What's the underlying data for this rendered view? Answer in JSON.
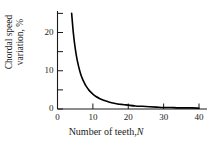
{
  "chart_data": {
    "type": "line",
    "title": "",
    "subtitle": "",
    "xlabel": "Number of teeth, N",
    "xlabel_text": "Number of teeth,",
    "xlabel_variable": "N",
    "ylabel": "Chordal speed variation, %",
    "ylabel_line1": "Chordal speed",
    "ylabel_line2": "variation, %",
    "xlim": [
      0,
      42
    ],
    "ylim": [
      0,
      26
    ],
    "xticks": [
      0,
      10,
      20,
      30,
      40
    ],
    "xticklabels": [
      "0",
      "10",
      "20",
      "30",
      "40"
    ],
    "yticks": [
      0,
      10,
      20
    ],
    "yticklabels": [
      "0",
      "10",
      "20"
    ],
    "y_minor_ticks": [
      5,
      15,
      25
    ],
    "grid": false,
    "legend": null,
    "legend_position": "none",
    "series": [
      {
        "name": "Chordal speed variation",
        "color": "#000000",
        "linewidth": 1.6,
        "x": [
          4,
          4.5,
          5,
          5.5,
          6,
          6.5,
          7,
          7.5,
          8,
          9,
          10,
          11,
          12,
          13,
          14,
          15,
          16,
          17,
          18,
          19,
          20,
          22,
          24,
          26,
          28,
          30,
          32,
          34,
          36,
          38,
          40
        ],
        "y": [
          25.0,
          19.7,
          15.9,
          13.1,
          11.0,
          9.3,
          8.0,
          7.0,
          6.1,
          4.8,
          3.9,
          3.2,
          2.7,
          2.3,
          2.0,
          1.7,
          1.5,
          1.3,
          1.2,
          1.1,
          1.0,
          0.8,
          0.7,
          0.6,
          0.5,
          0.4,
          0.4,
          0.3,
          0.3,
          0.3,
          0.2
        ]
      }
    ],
    "annotations": [],
    "axis_color": "#1a1a1a"
  },
  "axes": {
    "x_axis_name": "x-axis",
    "y_axis_name": "y-axis",
    "tick_direction": "inward"
  },
  "colors": {
    "background": "#ffffff",
    "curve": "#000000",
    "axis": "#1a1a1a",
    "text": "#1a1a1a"
  }
}
